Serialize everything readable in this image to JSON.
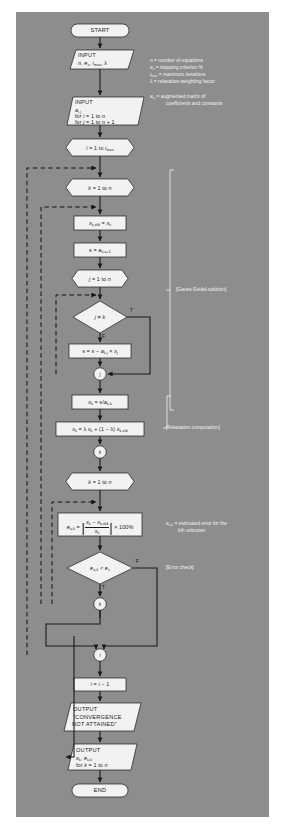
{
  "diagram": {
    "bg_color": "#8d8d8d",
    "node_fill": "#f2f2f2",
    "line_color": "#1a1a1a"
  },
  "nodes": {
    "start": "START",
    "input1_label": "INPUT",
    "input1_vars": "n, es, imax, λ",
    "input2_label": "INPUT",
    "input2_l1": "ai,j",
    "input2_l2": "for i = 1 to n",
    "input2_l3": "for j = 1 to n + 1",
    "loop_i_outer": "i = 1 to imax",
    "loop_k": "k = 1 to n",
    "assign_old": "xk,old = xk",
    "assign_s": "s = ak,n+1",
    "loop_j": "j = 1 to n",
    "decision_jk": "j ≠ k",
    "assign_s2": "s = s − ak,j × xj",
    "conn_j": "j",
    "assign_xk": "xk = s/ak,k",
    "assign_relax": "xk = λ xk + (1 − λ) xk,old",
    "conn_k1": "k",
    "loop_k2": "k = 1 to n",
    "error_formula": "ea,k = | (xk − xk,old) / xk | × 100%",
    "error_percent": "× 100%",
    "decision_err": "ea,k < es",
    "conn_k2": "k",
    "conn_i": "i",
    "assign_i": "i = i − 1",
    "output_fail_l1": "OUTPUT",
    "output_fail_l2": "“CONVERGENCE",
    "output_fail_l3": "NOT ATTAINED”",
    "output_ok_label": "OUTPUT",
    "output_ok_l1": "xk, ea,k",
    "output_ok_l2": "for k = 1 to n",
    "end": "END"
  },
  "branch_labels": {
    "jk_true": "T",
    "jk_false": "F",
    "err_true": "T",
    "err_false": "F"
  },
  "legend": [
    "n = number of equations",
    "es = stopping criterion %",
    "imax = maximum iterations",
    "λ = relaxation weighting factor",
    "ai,j = augmented matrix of",
    "coefficients and constants"
  ],
  "annotations": {
    "gauss_seidel": "[Gauss-Seidel solution]",
    "relaxation": "[Relaxation computation]",
    "error_def_l1": "ea,k = estimated error for the",
    "error_def_l2": "kth unknown",
    "error_check": "[Error check]"
  }
}
